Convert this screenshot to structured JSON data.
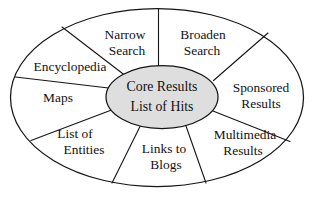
{
  "diagram": {
    "type": "radial-segment-ellipse",
    "title": "Core Results List of Hits",
    "background_color": "#ffffff",
    "outline_color": "#151515",
    "core": {
      "fill_color": "#dedede",
      "line1": "Core Results",
      "line2": "List of Hits"
    },
    "segments": [
      {
        "id": "narrow-search",
        "line1": "Narrow",
        "line2": "Search",
        "position": "top-left"
      },
      {
        "id": "broaden-search",
        "line1": "Broaden",
        "line2": "Search",
        "position": "top-right"
      },
      {
        "id": "sponsored-results",
        "line1": "Sponsored",
        "line2": "Results",
        "position": "right"
      },
      {
        "id": "multimedia-results",
        "line1": "Multimedia",
        "line2": "Results",
        "position": "bottom-right"
      },
      {
        "id": "links-to-blogs",
        "line1": "Links to",
        "line2": "Blogs",
        "position": "bottom"
      },
      {
        "id": "list-of-entities",
        "line1": "List of",
        "line2": "Entities",
        "position": "bottom-left"
      },
      {
        "id": "maps",
        "line1": "Maps",
        "line2": "",
        "position": "left"
      },
      {
        "id": "encyclopedia",
        "line1": "Encyclopedia",
        "line2": "",
        "position": "upper-left"
      }
    ]
  }
}
